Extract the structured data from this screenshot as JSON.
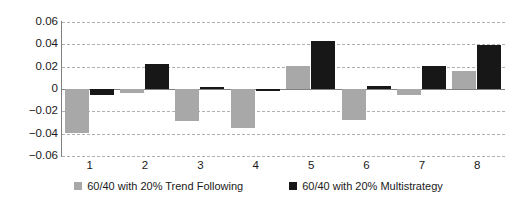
{
  "chart_data": {
    "type": "bar",
    "title": "",
    "xlabel": "",
    "ylabel": "",
    "categories": [
      "1",
      "2",
      "3",
      "4",
      "5",
      "6",
      "7",
      "8"
    ],
    "ylim": [
      -0.06,
      0.06
    ],
    "ytick_values": [
      0.06,
      0.04,
      0.02,
      0,
      -0.02,
      -0.04,
      -0.06
    ],
    "ytick_labels": [
      "0.06",
      "0.04",
      "0.02",
      "0",
      "−0.02",
      "−0.04",
      "−0.06"
    ],
    "grid": true,
    "grid_style": "dashed-horizontal",
    "legend_position": "bottom-center",
    "series": [
      {
        "name": "60/40 with 20% Trend Following",
        "color": "#a8a8a8",
        "values": [
          -0.039,
          -0.004,
          -0.029,
          -0.035,
          0.021,
          -0.028,
          -0.005,
          0.016
        ]
      },
      {
        "name": "60/40 with 20% Multistrategy",
        "color": "#171717",
        "values": [
          -0.005,
          0.022,
          0.002,
          -0.002,
          0.043,
          0.003,
          0.021,
          0.039
        ]
      }
    ]
  },
  "legend": {
    "items": [
      {
        "label": "60/40 with 20% Trend Following",
        "swatch": "legend-swatch-gray"
      },
      {
        "label": "60/40 with 20% Multistrategy",
        "swatch": "legend-swatch-black"
      }
    ]
  },
  "colors": {
    "series_a": "#a8a8a8",
    "series_b": "#171717",
    "grid": "#b0b0b0",
    "axis": "#808080",
    "text": "#1a1a1a",
    "background": "#ffffff"
  }
}
